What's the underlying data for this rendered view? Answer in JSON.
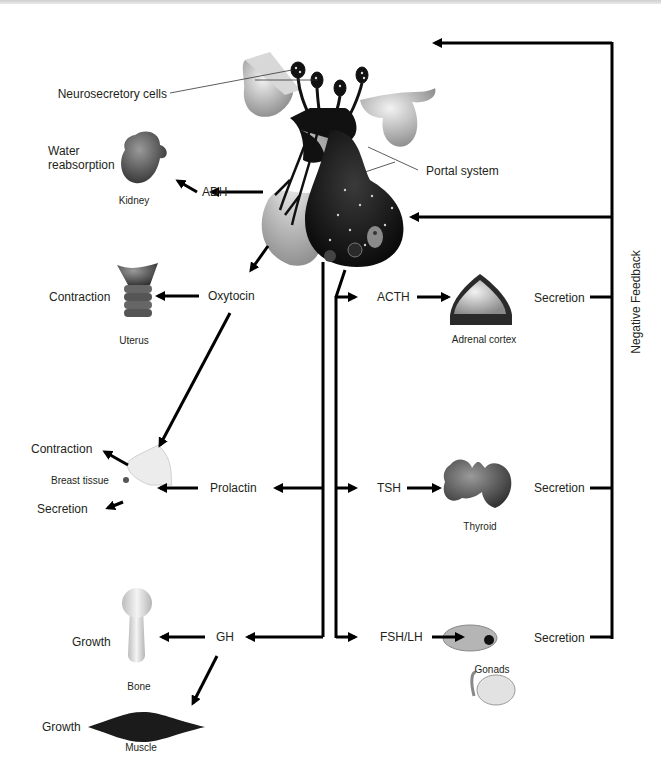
{
  "diagram": {
    "title_nodes": {
      "hypothalamus": "Hypothalamus",
      "neurosecretory_cells": "Neurosecretory cells",
      "portal_system": "Portal system",
      "negative_feedback": "Negative Feedback"
    },
    "posterior_pituitary_hormones": [
      {
        "hormone": "ADH",
        "target": "Kidney",
        "effect": "Water reabsorption"
      },
      {
        "hormone": "Oxytocin",
        "target": "Uterus",
        "effect": "Contraction"
      },
      {
        "hormone": "Oxytocin",
        "target": "Breast tissue",
        "effect": "Contraction"
      }
    ],
    "anterior_pituitary_hormones": [
      {
        "hormone": "ACTH",
        "target": "Adrenal cortex",
        "effect": "Secretion"
      },
      {
        "hormone": "TSH",
        "target": "Thyroid",
        "effect": "Secretion"
      },
      {
        "hormone": "FSH/LH",
        "target": "Gonads",
        "effect": "Secretion"
      },
      {
        "hormone": "Prolactin",
        "target": "Breast tissue",
        "effect": "Secretion"
      },
      {
        "hormone": "GH",
        "target": "Bone",
        "effect": "Growth"
      },
      {
        "hormone": "GH",
        "target": "Muscle",
        "effect": "Growth"
      }
    ],
    "labels": {
      "water": "Water",
      "reabsorption": "reabsorption",
      "kidney": "Kidney",
      "adh": "ADH",
      "oxytocin": "Oxytocin",
      "uterus": "Uterus",
      "uterus_effect": "Contraction",
      "breast_contraction": "Contraction",
      "breast_tissue": "Breast tissue",
      "breast_secretion": "Secretion",
      "prolactin": "Prolactin",
      "acth": "ACTH",
      "adrenal_cortex": "Adrenal cortex",
      "adrenal_secretion": "Secretion",
      "tsh": "TSH",
      "thyroid": "Thyroid",
      "thyroid_secretion": "Secretion",
      "fsh_lh": "FSH/LH",
      "gonads": "Gonads",
      "gonads_secretion": "Secretion",
      "gh": "GH",
      "bone": "Bone",
      "bone_growth": "Growth",
      "muscle": "Muscle",
      "muscle_growth": "Growth"
    }
  }
}
